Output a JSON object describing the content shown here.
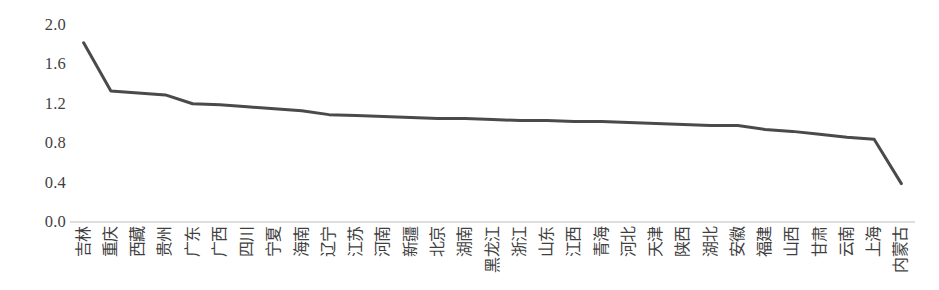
{
  "chart_data": {
    "type": "line",
    "title": "",
    "subtitle": "",
    "xlabel": "",
    "ylabel": "",
    "ylim": [
      0.0,
      2.0
    ],
    "y_ticks": [
      "0.0",
      "0.4",
      "0.8",
      "1.2",
      "1.6",
      "2.0"
    ],
    "y_tick_values": [
      0.0,
      0.4,
      0.8,
      1.2,
      1.6,
      2.0
    ],
    "grid": false,
    "legend": "none",
    "line_color": "#4a4a4a",
    "axis_color": "#bfbfbf",
    "tick_label_color": "#3f3f3f",
    "categories": [
      "吉林",
      "重庆",
      "西藏",
      "贵州",
      "广东",
      "广西",
      "四川",
      "宁夏",
      "海南",
      "辽宁",
      "江苏",
      "河南",
      "新疆",
      "北京",
      "湖南",
      "黑龙江",
      "浙江",
      "山东",
      "江西",
      "青海",
      "河北",
      "天津",
      "陕西",
      "湖北",
      "安徽",
      "福建",
      "山西",
      "甘肃",
      "云南",
      "上海",
      "内蒙古"
    ],
    "values": [
      1.82,
      1.33,
      1.31,
      1.29,
      1.2,
      1.19,
      1.17,
      1.15,
      1.13,
      1.09,
      1.08,
      1.07,
      1.06,
      1.05,
      1.05,
      1.04,
      1.03,
      1.03,
      1.02,
      1.02,
      1.01,
      1.0,
      0.99,
      0.98,
      0.98,
      0.94,
      0.92,
      0.89,
      0.86,
      0.84,
      0.39
    ],
    "series": [
      {
        "name": "series-1",
        "values": [
          1.82,
          1.33,
          1.31,
          1.29,
          1.2,
          1.19,
          1.17,
          1.15,
          1.13,
          1.09,
          1.08,
          1.07,
          1.06,
          1.05,
          1.05,
          1.04,
          1.03,
          1.03,
          1.02,
          1.02,
          1.01,
          1.0,
          0.99,
          0.98,
          0.98,
          0.94,
          0.92,
          0.89,
          0.86,
          0.84,
          0.39
        ]
      }
    ]
  }
}
